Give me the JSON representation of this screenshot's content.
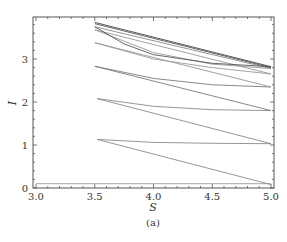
{
  "chart_data": {
    "type": "line",
    "title": "",
    "caption": "(a)",
    "xlabel": "S",
    "ylabel": "I",
    "xlim": [
      2.97,
      5.03
    ],
    "ylim": [
      0,
      3.97
    ],
    "xticks": [
      "3.0",
      "3.5",
      "4.0",
      "4.5",
      "5.0"
    ],
    "yticks": [
      "0",
      "1",
      "2",
      "3"
    ],
    "grid": false,
    "legend": null,
    "series": [
      {
        "name": "baseline",
        "x": [
          3.0,
          5.0
        ],
        "y": [
          0.1,
          0.1
        ],
        "color": "#9a9a9a"
      },
      {
        "name": "s1a",
        "x": [
          3.52,
          5.0
        ],
        "y": [
          1.13,
          0.08
        ],
        "color": "#8a8a8a"
      },
      {
        "name": "s1b",
        "x": [
          3.52,
          4.0,
          4.5,
          5.0
        ],
        "y": [
          1.13,
          1.06,
          1.04,
          1.03
        ],
        "color": "#8a8a8a"
      },
      {
        "name": "s2a",
        "x": [
          3.52,
          5.0
        ],
        "y": [
          2.08,
          1.03
        ],
        "color": "#8a8a8a"
      },
      {
        "name": "s2b",
        "x": [
          3.52,
          4.0,
          4.5,
          5.0
        ],
        "y": [
          2.08,
          1.9,
          1.82,
          1.8
        ],
        "color": "#8a8a8a"
      },
      {
        "name": "s3a",
        "x": [
          3.5,
          5.0
        ],
        "y": [
          2.83,
          1.8
        ],
        "color": "#7a7a7a"
      },
      {
        "name": "s3b",
        "x": [
          3.5,
          4.0,
          4.5,
          5.0
        ],
        "y": [
          2.83,
          2.55,
          2.4,
          2.35
        ],
        "color": "#7a7a7a"
      },
      {
        "name": "s4a",
        "x": [
          3.5,
          5.0
        ],
        "y": [
          3.38,
          2.35
        ],
        "color": "#999999"
      },
      {
        "name": "s4b",
        "x": [
          3.5,
          4.0,
          4.5,
          5.0
        ],
        "y": [
          3.38,
          3.0,
          2.8,
          2.65
        ],
        "color": "#999999"
      },
      {
        "name": "s5a",
        "x": [
          3.5,
          5.0
        ],
        "y": [
          3.68,
          2.65
        ],
        "color": "#999999"
      },
      {
        "name": "s5b",
        "x": [
          3.5,
          4.0,
          4.5,
          5.0
        ],
        "y": [
          3.68,
          3.15,
          2.88,
          2.78
        ],
        "color": "#999999"
      },
      {
        "name": "s6a",
        "x": [
          3.5,
          5.0
        ],
        "y": [
          3.75,
          2.78
        ],
        "color": "#888888"
      },
      {
        "name": "s6b",
        "x": [
          3.5,
          3.75,
          4.0,
          4.5,
          5.0
        ],
        "y": [
          3.75,
          3.35,
          3.1,
          2.9,
          2.82
        ],
        "color": "#555555"
      },
      {
        "name": "s7a",
        "x": [
          3.5,
          5.0
        ],
        "y": [
          3.85,
          2.82
        ],
        "color": "#444444"
      },
      {
        "name": "s7b",
        "x": [
          3.5,
          5.0
        ],
        "y": [
          3.82,
          2.8
        ],
        "color": "#555555"
      }
    ]
  }
}
